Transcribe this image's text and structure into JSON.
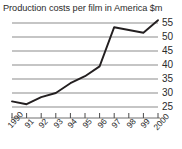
{
  "chart_data": {
    "type": "line",
    "title": "Production costs per film in America $m",
    "xlabel": "",
    "ylabel": "",
    "ylim": [
      23,
      57
    ],
    "ytick_values": [
      25,
      30,
      35,
      40,
      45,
      50,
      55
    ],
    "ytick_labels": [
      "25",
      "30",
      "35",
      "40",
      "45",
      "50",
      "55"
    ],
    "y_axis_position": "right",
    "grid": true,
    "grid_color": "#8c8c8c",
    "line_color": "#231f20",
    "background": "#ffffff",
    "legend": "none",
    "categories": [
      "1990",
      "91",
      "92",
      "93",
      "94",
      "95",
      "96",
      "97",
      "98",
      "99",
      "2000"
    ],
    "x": [
      1990,
      1991,
      1992,
      1993,
      1994,
      1995,
      1996,
      1997,
      1998,
      1999,
      2000
    ],
    "values": [
      27.0,
      26.0,
      28.5,
      30.0,
      33.5,
      36.0,
      39.5,
      53.5,
      52.5,
      51.5,
      56.0
    ],
    "series": [
      {
        "name": "Production costs per film",
        "values": [
          27.0,
          26.0,
          28.5,
          30.0,
          33.5,
          36.0,
          39.5,
          53.5,
          52.5,
          51.5,
          56.0
        ]
      }
    ]
  },
  "axis": {
    "y_labels": [
      "55",
      "50",
      "45",
      "40",
      "35",
      "30",
      "25"
    ],
    "x_labels": [
      "1990",
      "91",
      "92",
      "93",
      "94",
      "95",
      "96",
      "97",
      "98",
      "99",
      "2000"
    ]
  }
}
